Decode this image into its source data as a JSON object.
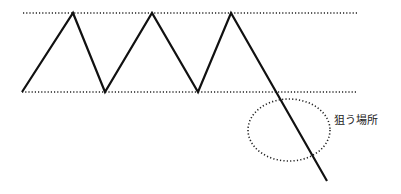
{
  "diagram": {
    "type": "chart-pattern",
    "colors": {
      "line": "#111111",
      "dotted": "#222222",
      "text": "#222222",
      "background": "#ffffff"
    },
    "annotation": {
      "label": "狙う場所"
    }
  }
}
